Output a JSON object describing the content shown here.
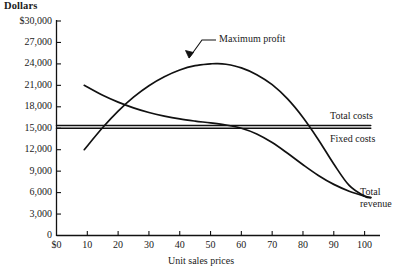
{
  "chart_data": {
    "type": "line",
    "title": "",
    "xlabel": "Unit sales prices",
    "ylabel": "Dollars",
    "xlim": [
      0,
      105
    ],
    "ylim": [
      0,
      30000
    ],
    "grid": false,
    "legend_position": "right-inline-labels",
    "y_ticks": [
      {
        "value": 30000,
        "label": "$30,000"
      },
      {
        "value": 27000,
        "label": "27,000"
      },
      {
        "value": 24000,
        "label": "24,000"
      },
      {
        "value": 21000,
        "label": "21,000"
      },
      {
        "value": 18000,
        "label": "18,000"
      },
      {
        "value": 15000,
        "label": "15,000"
      },
      {
        "value": 12000,
        "label": "12,000"
      },
      {
        "value": 9000,
        "label": "9,000"
      },
      {
        "value": 6000,
        "label": "6,000"
      },
      {
        "value": 3000,
        "label": "3,000"
      },
      {
        "value": 0,
        "label": "0"
      }
    ],
    "x_ticks": [
      {
        "value": 0,
        "label": "$0"
      },
      {
        "value": 10,
        "label": "10"
      },
      {
        "value": 20,
        "label": "20"
      },
      {
        "value": 30,
        "label": "30"
      },
      {
        "value": 40,
        "label": "40"
      },
      {
        "value": 50,
        "label": "50"
      },
      {
        "value": 60,
        "label": "60"
      },
      {
        "value": 70,
        "label": "70"
      },
      {
        "value": 80,
        "label": "80"
      },
      {
        "value": 90,
        "label": "90"
      },
      {
        "value": 100,
        "label": "100"
      }
    ],
    "series": [
      {
        "name": "Total revenue",
        "label": "Total revenue",
        "label_line1": "Total",
        "label_line2": "revenue",
        "x": [
          9,
          15,
          20,
          25,
          30,
          35,
          40,
          45,
          50,
          55,
          60,
          65,
          70,
          75,
          80,
          85,
          90,
          95,
          100,
          102
        ],
        "values": [
          21000,
          19600,
          18650,
          17850,
          17200,
          16700,
          16300,
          16000,
          15750,
          15450,
          15000,
          14200,
          13000,
          11500,
          9900,
          8400,
          7150,
          6200,
          5500,
          5300
        ]
      },
      {
        "name": "Profit curve",
        "label": "Maximum profit",
        "x": [
          9,
          15,
          20,
          25,
          30,
          35,
          40,
          45,
          50,
          52,
          55,
          60,
          65,
          70,
          75,
          80,
          85,
          90,
          95,
          100,
          102
        ],
        "values": [
          12000,
          15100,
          17400,
          19350,
          20950,
          22200,
          23150,
          23750,
          24000,
          24050,
          23950,
          23450,
          22500,
          21100,
          19100,
          16500,
          13400,
          10000,
          7000,
          5500,
          5300
        ]
      },
      {
        "name": "Total costs",
        "label": "Total costs",
        "x": [
          0,
          102
        ],
        "values": [
          15400,
          15400
        ]
      },
      {
        "name": "Fixed costs",
        "label": "Fixed costs",
        "x": [
          0,
          102
        ],
        "values": [
          15000,
          15000
        ]
      }
    ],
    "annotations": [
      {
        "text": "Maximum profit",
        "target_x": 52,
        "target_y": 24000
      }
    ]
  },
  "axes": {
    "y_title": "Dollars",
    "x_title": "Unit sales prices"
  },
  "colors": {
    "line": "#111111",
    "axis": "#111111",
    "background": "#ffffff"
  }
}
